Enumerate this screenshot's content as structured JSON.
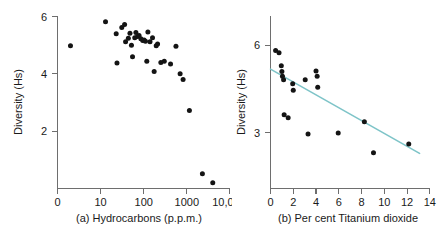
{
  "figure": {
    "background_color": "#ffffff",
    "point_color": "#141414",
    "axis_color": "#6e6e6e",
    "text_color": "#1a1a1a",
    "trendline_color": "#7ec4c8"
  },
  "chart_data": [
    {
      "type": "scatter",
      "panel": "a",
      "title": "",
      "xlabel": "(a) Hydrocarbons (p.p.m.)",
      "ylabel": "Diversity (Hs)",
      "xscale": "log",
      "yscale": "linear",
      "xticks": [
        0,
        10,
        100,
        1000,
        10000
      ],
      "xticklabels": [
        "0",
        "10",
        "100",
        "1000",
        "10,000"
      ],
      "yticks": [
        2,
        4,
        6
      ],
      "yticklabels": [
        "2",
        "4",
        "6"
      ],
      "xlim": [
        0,
        10000
      ],
      "ylim": [
        0,
        6
      ],
      "grid": false,
      "legend": false,
      "points": [
        {
          "x": 2.0,
          "y": 4.98
        },
        {
          "x": 13.0,
          "y": 5.82
        },
        {
          "x": 23.0,
          "y": 5.4
        },
        {
          "x": 24.0,
          "y": 4.38
        },
        {
          "x": 31.0,
          "y": 5.62
        },
        {
          "x": 36.0,
          "y": 5.72
        },
        {
          "x": 38.0,
          "y": 5.12
        },
        {
          "x": 44.0,
          "y": 5.24
        },
        {
          "x": 48.0,
          "y": 5.42
        },
        {
          "x": 52.0,
          "y": 5.0
        },
        {
          "x": 55.0,
          "y": 4.6
        },
        {
          "x": 62.0,
          "y": 5.26
        },
        {
          "x": 66.0,
          "y": 5.44
        },
        {
          "x": 72.0,
          "y": 5.3
        },
        {
          "x": 78.0,
          "y": 5.34
        },
        {
          "x": 86.0,
          "y": 5.22
        },
        {
          "x": 95.0,
          "y": 5.16
        },
        {
          "x": 102.0,
          "y": 5.18
        },
        {
          "x": 110.0,
          "y": 5.14
        },
        {
          "x": 118.0,
          "y": 4.44
        },
        {
          "x": 125.0,
          "y": 5.46
        },
        {
          "x": 140.0,
          "y": 5.12
        },
        {
          "x": 160.0,
          "y": 5.26
        },
        {
          "x": 175.0,
          "y": 4.08
        },
        {
          "x": 195.0,
          "y": 4.98
        },
        {
          "x": 210.0,
          "y": 5.04
        },
        {
          "x": 250.0,
          "y": 4.4
        },
        {
          "x": 300.0,
          "y": 4.44
        },
        {
          "x": 420.0,
          "y": 4.34
        },
        {
          "x": 560.0,
          "y": 4.96
        },
        {
          "x": 700.0,
          "y": 4.0
        },
        {
          "x": 820.0,
          "y": 3.8
        },
        {
          "x": 1150.0,
          "y": 2.72
        },
        {
          "x": 2300.0,
          "y": 0.52
        },
        {
          "x": 4000.0,
          "y": 0.2
        }
      ]
    },
    {
      "type": "scatter",
      "panel": "b",
      "title": "",
      "xlabel": "(b) Per cent Titanium dioxide",
      "ylabel": "Diversity (Hs)",
      "xscale": "linear",
      "yscale": "linear",
      "xticks": [
        0,
        2,
        4,
        6,
        8,
        10,
        12,
        14
      ],
      "xticklabels": [
        "0",
        "2",
        "4",
        "6",
        "8",
        "10",
        "12",
        "14"
      ],
      "yticks": [
        3,
        6
      ],
      "yticklabels": [
        "3",
        "6"
      ],
      "xlim": [
        0,
        14
      ],
      "ylim": [
        1.6,
        6.9
      ],
      "grid": false,
      "legend": false,
      "points": [
        {
          "x": 0.45,
          "y": 5.82
        },
        {
          "x": 0.75,
          "y": 5.74
        },
        {
          "x": 0.95,
          "y": 5.3
        },
        {
          "x": 1.0,
          "y": 5.1
        },
        {
          "x": 1.05,
          "y": 4.94
        },
        {
          "x": 1.15,
          "y": 4.82
        },
        {
          "x": 1.2,
          "y": 3.62
        },
        {
          "x": 1.55,
          "y": 3.52
        },
        {
          "x": 1.95,
          "y": 4.68
        },
        {
          "x": 2.0,
          "y": 4.46
        },
        {
          "x": 3.05,
          "y": 4.82
        },
        {
          "x": 3.3,
          "y": 2.96
        },
        {
          "x": 4.0,
          "y": 5.12
        },
        {
          "x": 4.1,
          "y": 4.94
        },
        {
          "x": 4.15,
          "y": 4.56
        },
        {
          "x": 5.95,
          "y": 3.0
        },
        {
          "x": 8.25,
          "y": 3.38
        },
        {
          "x": 9.05,
          "y": 2.32
        },
        {
          "x": 12.15,
          "y": 2.62
        }
      ],
      "trendline": {
        "x_start": 0.0,
        "y_start": 5.18,
        "x_end": 13.1,
        "y_end": 2.3,
        "color": "#7ec4c8"
      }
    }
  ]
}
